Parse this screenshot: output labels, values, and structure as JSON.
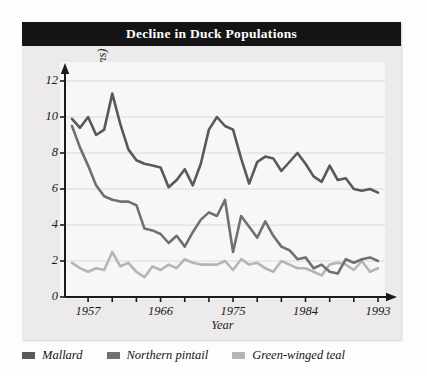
{
  "chart_data": {
    "type": "line",
    "title": "Decline in Duck Populations",
    "xlabel": "Year",
    "ylabel": "Population size (in millions)",
    "xlim": [
      1955,
      1993
    ],
    "ylim": [
      0,
      12
    ],
    "yticks": [
      0,
      2,
      4,
      6,
      8,
      10,
      12
    ],
    "xticks_major": [
      1957,
      1966,
      1975,
      1984,
      1993
    ],
    "xticks_minor": [
      1961,
      1970,
      1979,
      1988
    ],
    "grid": true,
    "grid_axis": "y",
    "legend_position": "below",
    "x": [
      1955,
      1956,
      1957,
      1958,
      1959,
      1960,
      1961,
      1962,
      1963,
      1964,
      1965,
      1966,
      1967,
      1968,
      1969,
      1970,
      1971,
      1972,
      1973,
      1974,
      1975,
      1976,
      1977,
      1978,
      1979,
      1980,
      1981,
      1982,
      1983,
      1984,
      1985,
      1986,
      1987,
      1988,
      1989,
      1990,
      1991,
      1992,
      1993
    ],
    "series": [
      {
        "name": "Mallard",
        "color": "#595959",
        "values": [
          9.9,
          9.4,
          10.0,
          9.0,
          9.3,
          11.3,
          9.6,
          8.2,
          7.6,
          7.4,
          7.3,
          7.2,
          6.1,
          6.5,
          7.1,
          6.2,
          7.4,
          9.3,
          10.0,
          9.5,
          9.3,
          7.7,
          6.3,
          7.5,
          7.8,
          7.7,
          7.0,
          7.5,
          8.0,
          7.4,
          6.7,
          6.4,
          7.3,
          6.5,
          6.6,
          6.0,
          5.9,
          6.0,
          5.8
        ]
      },
      {
        "name": "Northern pintail",
        "color": "#707070",
        "values": [
          9.5,
          8.3,
          7.3,
          6.2,
          5.6,
          5.4,
          5.3,
          5.3,
          5.1,
          3.8,
          3.7,
          3.5,
          3.0,
          3.4,
          2.8,
          3.6,
          4.3,
          4.7,
          4.5,
          5.4,
          2.5,
          4.5,
          3.9,
          3.3,
          4.2,
          3.4,
          2.8,
          2.6,
          2.1,
          2.2,
          1.6,
          1.8,
          1.4,
          1.3,
          2.1,
          1.9,
          2.1,
          2.2,
          2.0
        ]
      },
      {
        "name": "Green-winged teal",
        "color": "#b5b5b5",
        "values": [
          1.9,
          1.6,
          1.4,
          1.6,
          1.5,
          2.5,
          1.7,
          1.9,
          1.4,
          1.1,
          1.7,
          1.5,
          1.8,
          1.6,
          2.1,
          1.9,
          1.8,
          1.8,
          1.8,
          2.0,
          1.5,
          2.1,
          1.8,
          1.9,
          1.6,
          1.4,
          2.0,
          1.8,
          1.6,
          1.6,
          1.4,
          1.2,
          1.8,
          1.9,
          1.8,
          1.5,
          2.0,
          1.4,
          1.6
        ]
      }
    ]
  },
  "legend": {
    "entries": [
      {
        "label": "Mallard",
        "color": "#595959"
      },
      {
        "label": "Northern pintail",
        "color": "#707070"
      },
      {
        "label": "Green-winged teal",
        "color": "#b5b5b5"
      }
    ]
  }
}
